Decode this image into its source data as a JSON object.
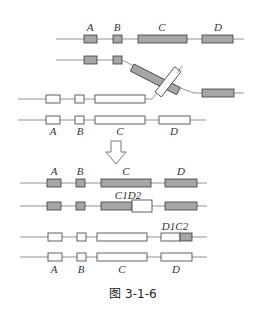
{
  "diagram": {
    "caption": "图 3-1-6",
    "colors": {
      "gray_exon": "#a6a6a6",
      "white_exon": "#ffffff",
      "stroke": "#3a3a3a",
      "line": "#777777"
    },
    "top_labels": [
      "A",
      "B",
      "C",
      "D"
    ],
    "pre_bottom_labels": [
      "A",
      "B",
      "C",
      "D"
    ],
    "after_top_labels": [
      "A",
      "B",
      "C",
      "D"
    ],
    "recomb_label_1": "C1D2",
    "recomb_label_2": "D1C2",
    "final_labels": [
      "A",
      "B",
      "C",
      "D"
    ],
    "arrow": "down-arrow"
  }
}
